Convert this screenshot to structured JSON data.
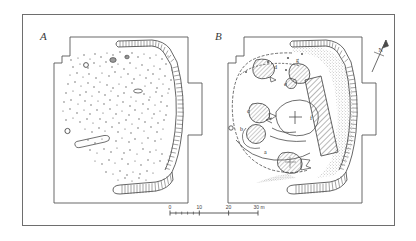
{
  "figure": {
    "type": "archaeological-site-plan",
    "panels": [
      {
        "id": "A",
        "label": "A",
        "description": "Plan showing excavated features as scattered small dots (postholes and stake holes), two small ring features, one elongated slot, and the hatched rampart/palisade line along the east and south sides."
      },
      {
        "id": "B",
        "label": "B",
        "description": "Interpretive plan showing the enclosure circuit, stippled rampart spread, a diagonally hatched excavation trench, and seven lettered features a to g."
      }
    ]
  },
  "panel_a": {
    "label": "A",
    "colors": {
      "ink": "#3a3a3a",
      "dot": "#555555",
      "boundary": "#4a4a4a"
    }
  },
  "panel_b": {
    "label": "B",
    "colors": {
      "ink": "#3a3a3a",
      "stipple": "#8a8a8a",
      "hatch": "#5a5a5a",
      "boundary": "#4a4a4a"
    },
    "feature_labels": [
      {
        "id": "a",
        "label": "a",
        "x": 264,
        "y": 154
      },
      {
        "id": "b",
        "label": "b",
        "x": 240,
        "y": 131
      },
      {
        "id": "c",
        "label": "c",
        "x": 247,
        "y": 113
      },
      {
        "id": "d",
        "label": "d",
        "x": 274,
        "y": 69
      },
      {
        "id": "e",
        "label": "e",
        "x": 295,
        "y": 81
      },
      {
        "id": "f",
        "label": "f",
        "x": 312,
        "y": 110
      },
      {
        "id": "g",
        "label": "g",
        "x": 302,
        "y": 63
      }
    ]
  },
  "north_arrow": {
    "label": "N",
    "name": "north-arrow"
  },
  "scale_bar": {
    "unit": "m",
    "ticks": [
      {
        "label": "0",
        "value": 0
      },
      {
        "label": "10",
        "value": 10
      },
      {
        "label": "20",
        "value": 20
      },
      {
        "label": "30",
        "value": 30
      }
    ],
    "unit_label": "m",
    "max_label": "30 m"
  }
}
